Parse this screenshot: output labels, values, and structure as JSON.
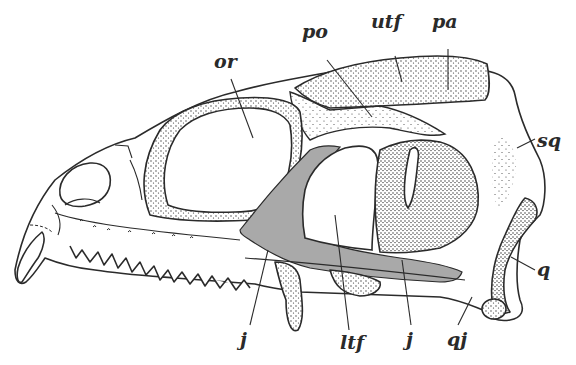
{
  "figure": {
    "colors": {
      "outline": "#2b2b2b",
      "shaded_bone": "#a9a9a9",
      "background": "#ffffff"
    },
    "labels": [
      {
        "id": "or",
        "text": "or",
        "x": 214,
        "y": 52
      },
      {
        "id": "po",
        "text": "po",
        "x": 302,
        "y": 22
      },
      {
        "id": "utf",
        "text": "utf",
        "x": 371,
        "y": 12
      },
      {
        "id": "pa",
        "text": "pa",
        "x": 432,
        "y": 12
      },
      {
        "id": "sq",
        "text": "sq",
        "x": 537,
        "y": 131
      },
      {
        "id": "q",
        "text": "q",
        "x": 537,
        "y": 260
      },
      {
        "id": "j_left",
        "text": "j",
        "x": 240,
        "y": 330
      },
      {
        "id": "ltf",
        "text": "ltf",
        "x": 340,
        "y": 333
      },
      {
        "id": "j_right",
        "text": "j",
        "x": 406,
        "y": 330
      },
      {
        "id": "qj",
        "text": "qj",
        "x": 447,
        "y": 330
      }
    ]
  }
}
